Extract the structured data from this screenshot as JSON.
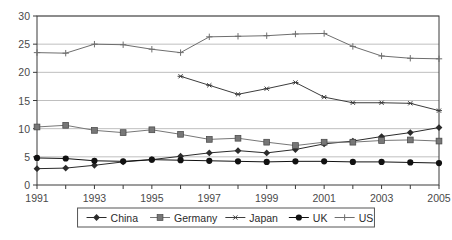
{
  "chart_data": {
    "type": "line",
    "title": "",
    "xlabel": "",
    "ylabel": "",
    "x": [
      1991,
      1992,
      1993,
      1994,
      1995,
      1996,
      1997,
      1998,
      1999,
      2000,
      2001,
      2002,
      2003,
      2004,
      2005
    ],
    "xtick_labels": [
      "1991",
      "1993",
      "1995",
      "1997",
      "1999",
      "2001",
      "2003",
      "2005"
    ],
    "xtick_values": [
      1991,
      1993,
      1995,
      1997,
      1999,
      2001,
      2003,
      2005
    ],
    "ytick_labels": [
      "0",
      "5",
      "10",
      "15",
      "20",
      "25",
      "30"
    ],
    "ytick_values": [
      0,
      5,
      10,
      15,
      20,
      25,
      30
    ],
    "xlim": [
      1991,
      2005
    ],
    "ylim": [
      0,
      30
    ],
    "grid": "horizontal",
    "legend_position": "bottom",
    "series": [
      {
        "name": "China",
        "marker": "diamond",
        "color": "#2b2b2b",
        "x": [
          1991,
          1992,
          1993,
          1994,
          1995,
          1996,
          1997,
          1998,
          1999,
          2000,
          2001,
          2002,
          2003,
          2004,
          2005
        ],
        "values": [
          2.9,
          3.0,
          3.5,
          4.1,
          4.5,
          5.1,
          5.7,
          6.1,
          5.7,
          6.3,
          7.3,
          7.8,
          8.6,
          9.3,
          10.2
        ]
      },
      {
        "name": "Germany",
        "marker": "square",
        "color": "#777777",
        "x": [
          1991,
          1992,
          1993,
          1994,
          1995,
          1996,
          1997,
          1998,
          1999,
          2000,
          2001,
          2002,
          2003,
          2004,
          2005
        ],
        "values": [
          10.3,
          10.6,
          9.7,
          9.3,
          9.8,
          9.0,
          8.1,
          8.3,
          7.6,
          7.0,
          7.6,
          7.6,
          7.9,
          8.0,
          7.8
        ]
      },
      {
        "name": "Japan",
        "marker": "asterisk",
        "color": "#3d3d3d",
        "x": [
          1996,
          1997,
          1998,
          1999,
          2000,
          2001,
          2002,
          2003,
          2004,
          2005
        ],
        "values": [
          19.3,
          17.7,
          16.1,
          17.1,
          18.2,
          15.6,
          14.6,
          14.6,
          14.5,
          13.2
        ]
      },
      {
        "name": "UK",
        "marker": "circle",
        "color": "#111111",
        "x": [
          1991,
          1992,
          1993,
          1994,
          1995,
          1996,
          1997,
          1998,
          1999,
          2000,
          2001,
          2002,
          2003,
          2004,
          2005
        ],
        "values": [
          4.8,
          4.7,
          4.3,
          4.2,
          4.5,
          4.4,
          4.3,
          4.2,
          4.1,
          4.2,
          4.2,
          4.1,
          4.1,
          4.0,
          3.9
        ]
      },
      {
        "name": "US",
        "marker": "plus",
        "color": "#6e6e6e",
        "x": [
          1991,
          1992,
          1993,
          1994,
          1995,
          1996,
          1997,
          1998,
          1999,
          2000,
          2001,
          2002,
          2003,
          2004,
          2005
        ],
        "values": [
          23.5,
          23.4,
          25.0,
          24.9,
          24.1,
          23.5,
          26.3,
          26.4,
          26.5,
          26.8,
          26.9,
          24.6,
          22.9,
          22.5,
          22.4
        ]
      }
    ]
  },
  "legend": {
    "entries": [
      {
        "label": "China",
        "marker": "diamond"
      },
      {
        "label": "Germany",
        "marker": "square"
      },
      {
        "label": "Japan",
        "marker": "asterisk"
      },
      {
        "label": "UK",
        "marker": "circle"
      },
      {
        "label": "US",
        "marker": "plus"
      }
    ]
  },
  "colors": {
    "plot_border": "#3a3a3a",
    "gridline": "#bfbfbf",
    "legend_border": "#555555",
    "background": "#ffffff",
    "tick_text": "#4a4a4a"
  }
}
